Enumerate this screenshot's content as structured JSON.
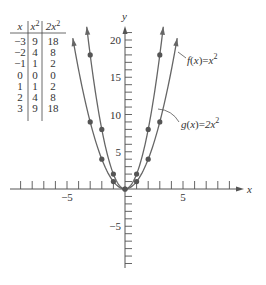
{
  "table": {
    "headers": [
      "x",
      "x²",
      "2x²"
    ],
    "rows": [
      [
        "−3",
        "9",
        "18"
      ],
      [
        "−2",
        "4",
        "8"
      ],
      [
        "−1",
        "1",
        "2"
      ],
      [
        "0",
        "0",
        "0"
      ],
      [
        "1",
        "1",
        "2"
      ],
      [
        "2",
        "4",
        "8"
      ],
      [
        "3",
        "9",
        "18"
      ]
    ]
  },
  "axes": {
    "x_label": "x",
    "y_label": "y",
    "x_tick_labels": [
      {
        "value": -5,
        "text": "−5"
      },
      {
        "value": 5,
        "text": "5"
      }
    ],
    "y_tick_labels": [
      {
        "value": 20,
        "text": "20"
      },
      {
        "value": 15,
        "text": "15"
      },
      {
        "value": 10,
        "text": "10"
      },
      {
        "value": 5,
        "text": "5"
      },
      {
        "value": -5,
        "text": "−5"
      }
    ]
  },
  "labels": {
    "f": {
      "name": "f",
      "arg": "x",
      "rhs": "x",
      "exp": "2"
    },
    "g": {
      "name": "g",
      "arg": "x",
      "rhs": "2x",
      "exp": "2"
    }
  },
  "colors": {
    "curve": "#666666",
    "point": "#555555",
    "axis": "#555555",
    "text": "#333333"
  },
  "chart_data": {
    "type": "line",
    "title": "",
    "xlabel": "x",
    "ylabel": "y",
    "xlim": [
      -10,
      10
    ],
    "ylim": [
      -10.5,
      22
    ],
    "x_ticks": [
      -9,
      -8,
      -7,
      -6,
      -5,
      -4,
      -3,
      -2,
      -1,
      1,
      2,
      3,
      4,
      5,
      6,
      7,
      8,
      9
    ],
    "y_ticks": [
      -10,
      -9,
      -8,
      -7,
      -6,
      -5,
      -4,
      -3,
      -2,
      -1,
      1,
      2,
      3,
      4,
      5,
      6,
      7,
      8,
      9,
      10,
      11,
      12,
      13,
      14,
      15,
      16,
      17,
      18,
      19,
      20,
      21
    ],
    "grid": false,
    "legend": "none (inline labels)",
    "series": [
      {
        "name": "f(x)=x^2",
        "x": [
          -3,
          -2,
          -1,
          0,
          1,
          2,
          3
        ],
        "values": [
          9,
          4,
          1,
          0,
          1,
          4,
          9
        ],
        "curve_domain": [
          -4.5,
          4.5
        ]
      },
      {
        "name": "g(x)=2x^2",
        "x": [
          -3,
          -2,
          -1,
          0,
          1,
          2,
          3
        ],
        "values": [
          18,
          8,
          2,
          0,
          2,
          8,
          18
        ],
        "curve_domain": [
          -3.3,
          3.3
        ]
      }
    ],
    "table": {
      "columns": [
        "x",
        "x^2",
        "2x^2"
      ],
      "rows": [
        [
          -3,
          9,
          18
        ],
        [
          -2,
          4,
          8
        ],
        [
          -1,
          1,
          2
        ],
        [
          0,
          0,
          0
        ],
        [
          1,
          1,
          2
        ],
        [
          2,
          4,
          8
        ],
        [
          3,
          9,
          18
        ]
      ]
    }
  }
}
